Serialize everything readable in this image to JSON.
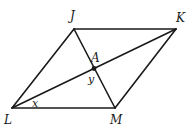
{
  "diagram": {
    "type": "rhombus-with-diagonals",
    "vertices": [
      {
        "id": "J",
        "label": "J",
        "x": 74,
        "y": 29
      },
      {
        "id": "K",
        "label": "K",
        "x": 176,
        "y": 29
      },
      {
        "id": "M",
        "label": "M",
        "x": 115,
        "y": 108
      },
      {
        "id": "L",
        "label": "L",
        "x": 12,
        "y": 108
      }
    ],
    "intersection": {
      "id": "A",
      "label": "A",
      "x": 94,
      "y": 68
    },
    "angle_labels": {
      "x": "x",
      "y": "y"
    },
    "labels": {
      "J": "J",
      "K": "K",
      "L": "L",
      "M": "M",
      "A": "A",
      "x": "x",
      "y": "y"
    },
    "colors": {
      "stroke": "#1a1a1a",
      "background": "#ffffff"
    }
  }
}
